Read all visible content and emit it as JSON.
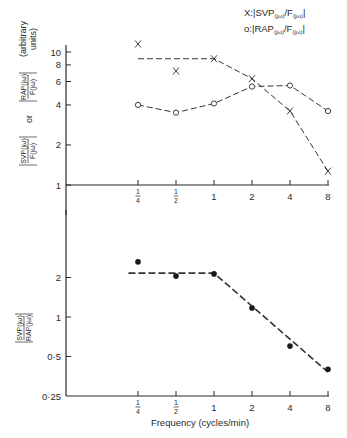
{
  "chart_data": [
    {
      "type": "line",
      "title": "",
      "legend": [
        {
          "marker": "X",
          "label": "X: |SVP(jω)/F(jω)|"
        },
        {
          "marker": "o",
          "label": "o: |RAP(jω)/F(jω)|"
        }
      ],
      "legend_position": "top-right",
      "xlabel": "",
      "ylabel": "|SVP(jω)/F(jω)| or |RAP(jω)/F(jω)| (arbitrary units)",
      "xscale": "log2",
      "yscale": "log",
      "x": [
        0.25,
        0.5,
        1,
        2,
        4,
        8
      ],
      "xtick_labels": [
        "1/4",
        "1/2",
        "1",
        "2",
        "4",
        "8"
      ],
      "yticks": [
        1,
        2,
        4,
        6,
        8,
        10
      ],
      "ytick_labels": [
        "1",
        "2",
        "4",
        "6",
        "8",
        "10"
      ],
      "ylim": [
        1,
        12
      ],
      "grid": false,
      "series": [
        {
          "name": "|SVP(jω)/F(jω)|",
          "marker": "X",
          "values": [
            11.5,
            7.2,
            8.9,
            6.3,
            3.6,
            1.27
          ]
        },
        {
          "name": "|RAP(jω)/F(jω)|",
          "marker": "o",
          "values": [
            4.0,
            3.5,
            4.1,
            5.5,
            5.6,
            3.6
          ]
        }
      ],
      "fit_lines": [
        {
          "name": "SVP fit",
          "style": "dashed",
          "points": [
            [
              0.25,
              8.9
            ],
            [
              1,
              8.9
            ],
            [
              2,
              6.3
            ],
            [
              4,
              3.6
            ],
            [
              8,
              1.27
            ]
          ]
        }
      ]
    },
    {
      "type": "scatter",
      "title": "",
      "xlabel": "Frequency (cycles/min)",
      "ylabel": "|SVP(jω)/RAP(jω)|",
      "xscale": "log2",
      "yscale": "log2",
      "x": [
        0.25,
        0.5,
        1,
        2,
        4,
        8
      ],
      "xtick_labels": [
        "1/4",
        "1/2",
        "1",
        "2",
        "4",
        "8"
      ],
      "yticks": [
        0.25,
        0.5,
        1,
        2
      ],
      "ytick_labels": [
        "0·25",
        "0·5",
        "1",
        "2"
      ],
      "ylim": [
        0.25,
        4
      ],
      "grid": false,
      "series": [
        {
          "name": "|SVP(jω)/RAP(jω)|",
          "marker": "filled-circle",
          "values": [
            2.63,
            2.05,
            2.13,
            1.17,
            0.6,
            0.4
          ]
        }
      ],
      "fit_lines": [
        {
          "name": "ratio fit",
          "style": "dashed",
          "points": [
            [
              0.21,
              2.16
            ],
            [
              1,
              2.16
            ],
            [
              8,
              0.38
            ]
          ]
        }
      ]
    }
  ],
  "top_panel": {
    "legend_x": "X: |SVP",
    "legend_o": "o: |RAP",
    "ylabel_units": "(arbitrary units)",
    "ylabel_or": "or"
  },
  "bottom_panel": {
    "xlabel": "Frequency (cycles/min)"
  }
}
